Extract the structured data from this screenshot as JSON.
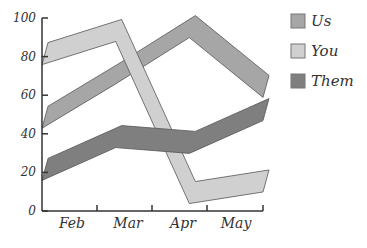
{
  "chart_data": {
    "type": "line",
    "title": "",
    "xlabel": "",
    "ylabel": "",
    "categories": [
      "Feb",
      "Mar",
      "Apr",
      "May"
    ],
    "ylim": [
      0,
      100
    ],
    "yticks": [
      0,
      20,
      40,
      60,
      80,
      100
    ],
    "grid": false,
    "legend_position": "right",
    "style": "3D ribbon bands",
    "series": [
      {
        "name": "Us",
        "color": "#a6a6a6",
        "values": [
          47,
          70,
          94,
          63
        ]
      },
      {
        "name": "You",
        "color": "#d0d0d0",
        "values": [
          80,
          92,
          8,
          14
        ]
      },
      {
        "name": "Them",
        "color": "#7f7f7f",
        "values": [
          20,
          37,
          34,
          51
        ]
      }
    ]
  },
  "axis": {
    "ytick_labels": [
      "0",
      "20",
      "40",
      "60",
      "80",
      "100"
    ],
    "xtick_labels": [
      "Feb",
      "Mar",
      "Apr",
      "May"
    ]
  },
  "legend": {
    "items": [
      {
        "label": "Us",
        "color": "#a6a6a6"
      },
      {
        "label": "You",
        "color": "#d0d0d0"
      },
      {
        "label": "Them",
        "color": "#7f7f7f"
      }
    ]
  }
}
